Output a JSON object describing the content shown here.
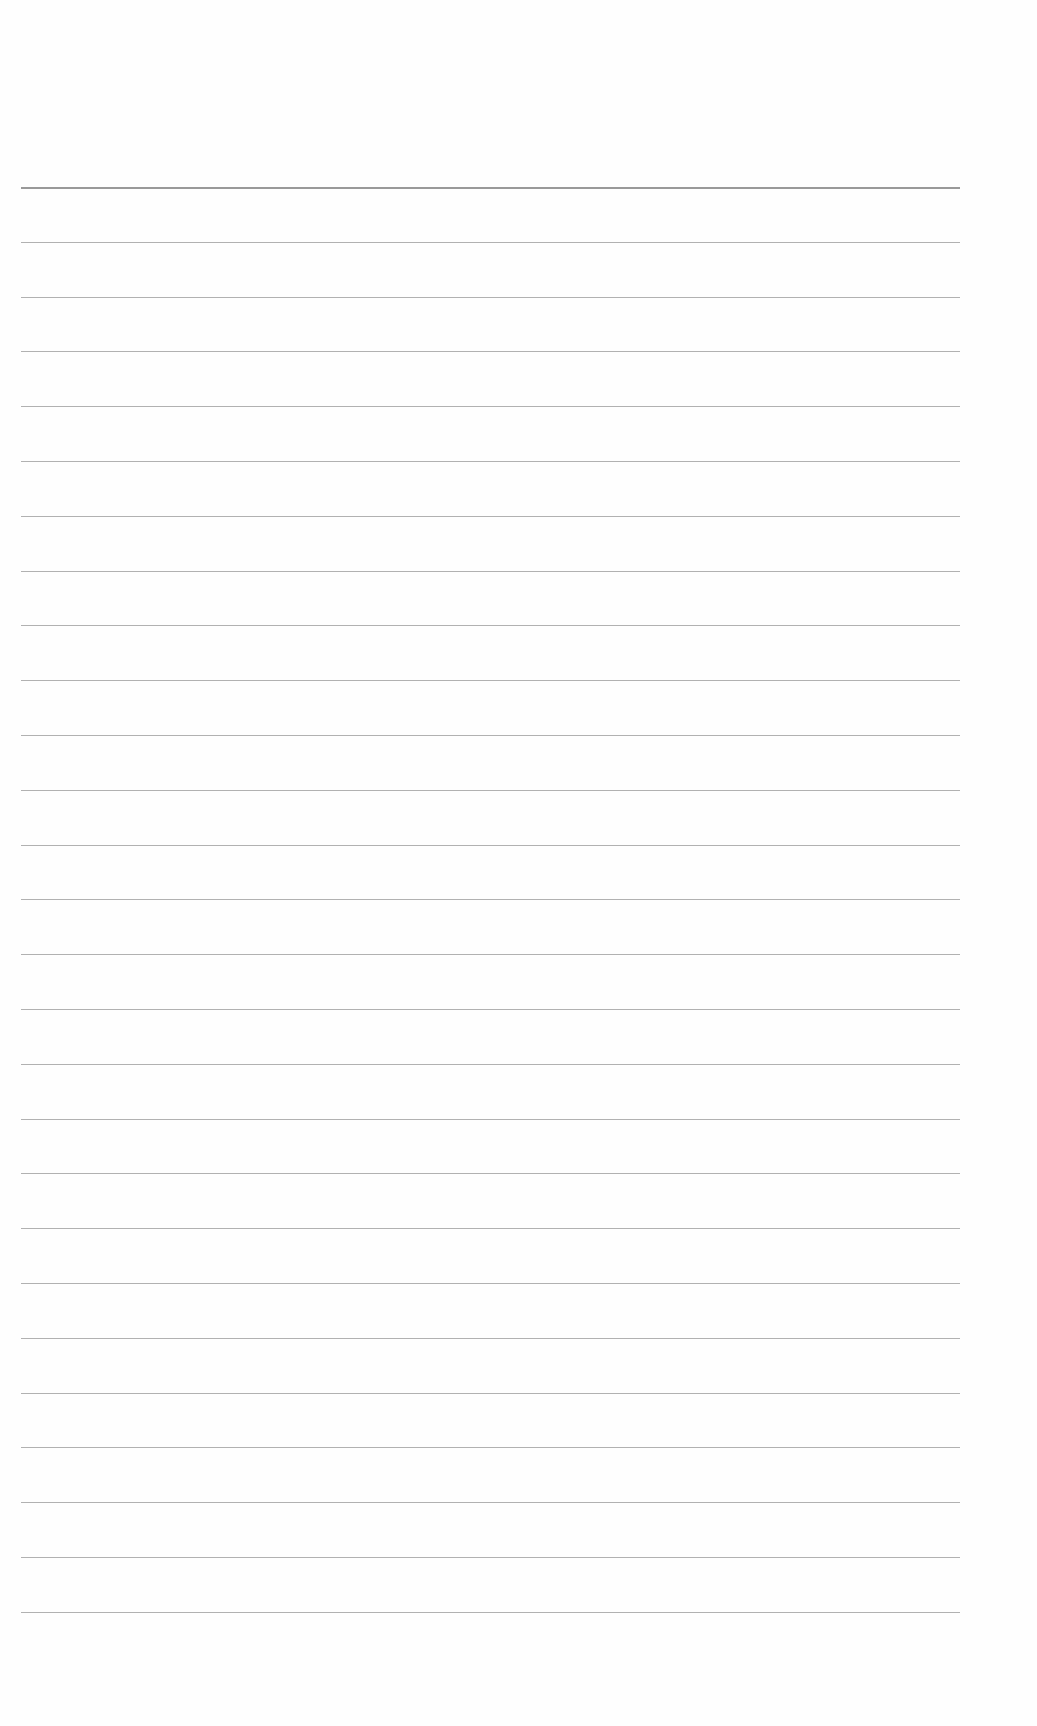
{
  "document": {
    "type": "lined-paper",
    "line_color": "#a3a3a3",
    "first_line_color": "#8e8e8e",
    "line_count": 27,
    "first_line_y": 187,
    "line_spacing": 54.8,
    "line_left": 21,
    "line_width": 939
  }
}
